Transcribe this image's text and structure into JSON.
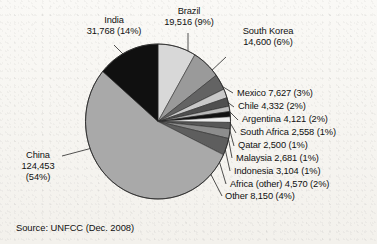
{
  "figure": {
    "source_note": "Source: UNFCC (Dec. 2008)"
  },
  "chart_data": {
    "type": "pie",
    "title": "",
    "subtitle": "",
    "xlabel": "",
    "ylabel": "",
    "legend_position": "callout-labels",
    "grid": false,
    "units": "projected CERs (thousands)",
    "total": 230000,
    "categories": [
      "Brazil",
      "South Korea",
      "Mexico",
      "Chile",
      "Argentina",
      "South Africa",
      "Qatar",
      "Malaysia",
      "Indonesia",
      "Africa (other)",
      "Other",
      "China",
      "India"
    ],
    "values": [
      19516,
      14600,
      7627,
      4332,
      4121,
      2558,
      2500,
      2681,
      3104,
      4570,
      8150,
      124453,
      31768
    ],
    "percents": [
      9,
      6,
      3,
      2,
      2,
      1,
      1,
      1,
      1,
      2,
      4,
      54,
      14
    ],
    "colors": [
      "#d8d8d8",
      "#9a9a9a",
      "#636363",
      "#c9c9c9",
      "#4f4f4f",
      "#b8b8b8",
      "#121212",
      "#ededed",
      "#585858",
      "#8d8d8d",
      "#5e5e5e",
      "#a9a9a9",
      "#101010"
    ],
    "slices": [
      {
        "name": "Brazil",
        "value": 19516,
        "value_label": "19,516",
        "percent": 9,
        "percent_label": "(9%)",
        "label": "Brazil 19,516 (9%)",
        "color": "#d8d8d8"
      },
      {
        "name": "South Korea",
        "value": 14600,
        "value_label": "14,600",
        "percent": 6,
        "percent_label": "(6%)",
        "label": "South Korea 14,600 (6%)",
        "color": "#9a9a9a"
      },
      {
        "name": "Mexico",
        "value": 7627,
        "value_label": "7,627",
        "percent": 3,
        "percent_label": "(3%)",
        "label": "Mexico 7,627 (3%)",
        "color": "#636363"
      },
      {
        "name": "Chile",
        "value": 4332,
        "value_label": "4,332",
        "percent": 2,
        "percent_label": "(2%)",
        "label": "Chile 4,332 (2%)",
        "color": "#c9c9c9"
      },
      {
        "name": "Argentina",
        "value": 4121,
        "value_label": "4,121",
        "percent": 2,
        "percent_label": "(2%)",
        "label": "Argentina 4,121 (2%)",
        "color": "#4f4f4f"
      },
      {
        "name": "South Africa",
        "value": 2558,
        "value_label": "2,558",
        "percent": 1,
        "percent_label": "(1%)",
        "label": "South Africa 2,558 (1%)",
        "color": "#b8b8b8"
      },
      {
        "name": "Qatar",
        "value": 2500,
        "value_label": "2,500",
        "percent": 1,
        "percent_label": "(1%)",
        "label": "Qatar 2,500 (1%)",
        "color": "#121212"
      },
      {
        "name": "Malaysia",
        "value": 2681,
        "value_label": "2,681",
        "percent": 1,
        "percent_label": "(1%)",
        "label": "Malaysia 2,681 (1%)",
        "color": "#ededed"
      },
      {
        "name": "Indonesia",
        "value": 3104,
        "value_label": "3,104",
        "percent": 1,
        "percent_label": "(1%)",
        "label": "Indonesia 3,104 (1%)",
        "color": "#585858"
      },
      {
        "name": "Africa (other)",
        "value": 4570,
        "value_label": "4,570",
        "percent": 2,
        "percent_label": "(2%)",
        "label": "Africa (other) 4,570 (2%)",
        "color": "#8d8d8d"
      },
      {
        "name": "Other",
        "value": 8150,
        "value_label": "8,150",
        "percent": 4,
        "percent_label": "(4%)",
        "label": "Other 8,150 (4%)",
        "color": "#5e5e5e"
      },
      {
        "name": "China",
        "value": 124453,
        "value_label": "124,453",
        "percent": 54,
        "percent_label": "(54%)",
        "label": "China 124,453 (54%)",
        "color": "#a9a9a9"
      },
      {
        "name": "India",
        "value": 31768,
        "value_label": "31,768",
        "percent": 14,
        "percent_label": "(14%)",
        "label": "India 31,768 (14%)",
        "color": "#101010"
      }
    ]
  },
  "labels": {
    "india": {
      "line1": "India",
      "line2": "31,768 (14%)"
    },
    "brazil": {
      "line1": "Brazil",
      "line2": "19,516 (9%)"
    },
    "south_korea": {
      "line1": "South Korea",
      "line2": "14,600 (6%)"
    },
    "mexico": {
      "text": "Mexico 7,627 (3%)"
    },
    "chile": {
      "text": "Chile 4,332 (2%)"
    },
    "argentina": {
      "text": "Argentina 4,121 (2%)"
    },
    "south_africa": {
      "text": "South Africa 2,558 (1%)"
    },
    "qatar": {
      "text": "Qatar 2,500 (1%)"
    },
    "malaysia": {
      "text": "Malaysia 2,681 (1%)"
    },
    "indonesia": {
      "text": "Indonesia 3,104 (1%)"
    },
    "africa_other": {
      "text": "Africa (other) 4,570 (2%)"
    },
    "other": {
      "text": "Other 8,150 (4%)"
    },
    "china": {
      "line1": "China",
      "line2": "124,453",
      "line3": "(54%)"
    }
  }
}
